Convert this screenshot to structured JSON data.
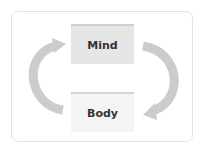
{
  "diagram": {
    "nodes": [
      {
        "id": "mind",
        "label": "Mind"
      },
      {
        "id": "body",
        "label": "Body"
      }
    ],
    "edges": [
      {
        "from": "mind",
        "to": "body",
        "side": "right"
      },
      {
        "from": "body",
        "to": "mind",
        "side": "left"
      }
    ],
    "colors": {
      "arrow": "#cccccc",
      "mind_fill": "#e6e6e6",
      "body_fill": "#f4f4f4",
      "text": "#333333",
      "border": "#e2e2e2"
    }
  }
}
